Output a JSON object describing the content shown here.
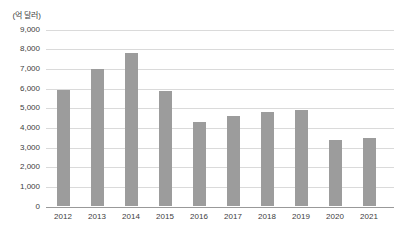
{
  "chart_data": {
    "type": "bar",
    "unit_label": "(억 달러)",
    "categories": [
      "2012",
      "2013",
      "2014",
      "2015",
      "2016",
      "2017",
      "2018",
      "2019",
      "2020",
      "2021"
    ],
    "values": [
      5900,
      7000,
      7800,
      5850,
      4300,
      4600,
      4800,
      4900,
      3400,
      3500
    ],
    "ylim": [
      0,
      9000
    ],
    "ytick_step": 1000,
    "grid": true,
    "legend_position": "none",
    "bar_color": "#9c9c9c",
    "gridline_color": "#dadada",
    "axis_color": "#999999",
    "text_color": "#404040"
  }
}
